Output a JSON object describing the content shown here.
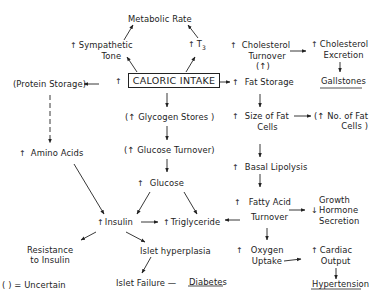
{
  "diagram": {
    "nodes": {
      "metabolic_rate": {
        "text": "Metabolic Rate"
      },
      "sympathetic_tone": {
        "prefix": "↑",
        "line1": "Sympathetic",
        "line2": "Tone"
      },
      "t3": {
        "prefix": "↑",
        "text": "T",
        "sub": "3"
      },
      "caloric_intake": {
        "prefix": "↑",
        "text": "CALORIC INTAKE"
      },
      "protein_storage": {
        "text": "(Protein Storage)"
      },
      "amino_acids": {
        "prefix": "↑",
        "text": "Amino Acids"
      },
      "glycogen_stores": {
        "text": "(↑ Glycogen Stores )"
      },
      "glucose_turnover": {
        "text": "(↑ Glucose Turnover)"
      },
      "glucose": {
        "prefix": "↑",
        "text": "Glucose"
      },
      "insulin": {
        "prefix": "↑",
        "text": "Insulin"
      },
      "triglyceride": {
        "prefix": "↑",
        "text": "Triglyceride"
      },
      "resistance_to_insulin": {
        "line1": "Resistance",
        "line2": "to Insulin"
      },
      "islet_hyperplasia": {
        "text": "Islet hyperplasia"
      },
      "islet_failure": {
        "text": "Islet Failure —"
      },
      "diabetes": {
        "text": "Diabetes"
      },
      "cholesterol_turnover": {
        "prefix": "↑",
        "line1": "Cholesterol",
        "line2": "Turnover"
      },
      "uncertain_arrow": {
        "text": "(↑)"
      },
      "fat_storage": {
        "prefix": "↑",
        "text": "Fat Storage"
      },
      "cholesterol_excretion": {
        "prefix": "↑",
        "line1": "Cholesterol",
        "line2": "Excretion"
      },
      "gallstones": {
        "text": "Gallstones"
      },
      "size_of_fat_cells": {
        "prefix": "↑",
        "line1": "Size of Fat",
        "line2": "Cells"
      },
      "no_of_fat_cells": {
        "line1": "(↑ No. of Fat",
        "line2": "Cells )"
      },
      "basal_lipolysis": {
        "prefix": "↑",
        "text": "Basal Lipolysis"
      },
      "fatty_acid_turnover": {
        "prefix": "↑",
        "line1": "Fatty Acid",
        "line2": "Turnover"
      },
      "growth_hormone": {
        "prefix": "↓",
        "line1": "Growth",
        "line2": "Hormone",
        "line3": "Secretion"
      },
      "oxygen_uptake": {
        "prefix": "↑",
        "line1": "Oxygen",
        "line2": "Uptake"
      },
      "cardiac_output": {
        "prefix": "↑",
        "line1": "Cardiac",
        "line2": "Output"
      },
      "hypertension": {
        "text": "Hypertension"
      }
    },
    "legend": {
      "text": "( ) = Uncertain"
    },
    "edges": [
      [
        "caloric_intake",
        "sympathetic_tone"
      ],
      [
        "sympathetic_tone",
        "metabolic_rate"
      ],
      [
        "caloric_intake",
        "t3"
      ],
      [
        "t3",
        "metabolic_rate"
      ],
      [
        "caloric_intake",
        "protein_storage"
      ],
      [
        "protein_storage",
        "amino_acids",
        "dashed"
      ],
      [
        "caloric_intake",
        "glycogen_stores"
      ],
      [
        "glycogen_stores",
        "glucose_turnover"
      ],
      [
        "glucose_turnover",
        "glucose"
      ],
      [
        "glucose",
        "insulin"
      ],
      [
        "glucose",
        "triglyceride"
      ],
      [
        "amino_acids",
        "insulin"
      ],
      [
        "insulin",
        "triglyceride"
      ],
      [
        "insulin",
        "resistance_to_insulin"
      ],
      [
        "insulin",
        "islet_hyperplasia"
      ],
      [
        "islet_hyperplasia",
        "islet_failure"
      ],
      [
        "caloric_intake",
        "fat_storage"
      ],
      [
        "cholesterol_turnover",
        "cholesterol_excretion"
      ],
      [
        "cholesterol_excretion",
        "gallstones"
      ],
      [
        "fat_storage",
        "size_of_fat_cells"
      ],
      [
        "size_of_fat_cells",
        "no_of_fat_cells"
      ],
      [
        "size_of_fat_cells",
        "basal_lipolysis"
      ],
      [
        "basal_lipolysis",
        "fatty_acid_turnover"
      ],
      [
        "fatty_acid_turnover",
        "triglyceride"
      ],
      [
        "fatty_acid_turnover",
        "growth_hormone"
      ],
      [
        "fatty_acid_turnover",
        "oxygen_uptake"
      ],
      [
        "oxygen_uptake",
        "cardiac_output"
      ],
      [
        "cardiac_output",
        "hypertension"
      ]
    ]
  }
}
